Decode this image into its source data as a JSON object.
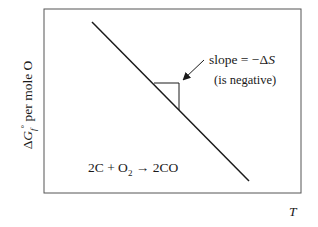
{
  "diagram": {
    "y_axis_label": {
      "delta": "Δ",
      "symbol": "G",
      "subscript": "f",
      "superscript": "°",
      "rest": " per mole O"
    },
    "x_axis_label": "T",
    "annotation": {
      "line1_prefix": "slope = −Δ",
      "line1_symbol": "S",
      "line2": "(is negative)"
    },
    "reaction": {
      "part1": "2C + O",
      "subscript": "2",
      "part2": " → 2CO"
    },
    "frame": {
      "x": 44,
      "y": 9,
      "width": 257,
      "height": 184
    },
    "line": {
      "x1": 92,
      "y1": 22,
      "x2": 249,
      "y2": 181
    },
    "slope_triangle": {
      "x_left": 154,
      "x_right": 179,
      "y_top": 83,
      "y_bottom": 110
    },
    "arrow": {
      "x1": 204,
      "y1": 60,
      "x2": 182,
      "y2": 81
    },
    "colors": {
      "stroke": "#1a1a1a",
      "frame": "#555555"
    }
  }
}
